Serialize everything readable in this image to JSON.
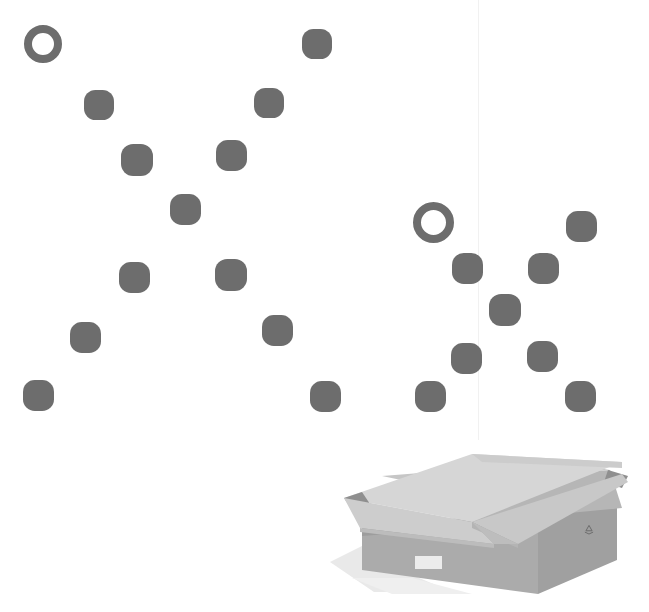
{
  "canvas": {
    "width": 649,
    "height": 612,
    "background": "#ffffff",
    "description": "Two X-shaped scatter patterns of gray rounded dots with one hollow ring each, above an open cardboard box"
  },
  "palette": {
    "dot_fill": "#6d6d6d",
    "ring_stroke": "#6d6d6d",
    "guide_line": "#f1f1f1",
    "box_flap_top": "#d3d3d3",
    "box_flap_light": "#c9c9c9",
    "box_inner": "#b9b9b9",
    "box_front": "#a9a9a9",
    "box_side": "#9b9b9b",
    "box_edge": "#8a8a8a",
    "box_shadow": "#e3e3e3",
    "label_white": "#eeeeee",
    "recycle_mark": "#6a6a6a"
  },
  "guide_lines": [
    {
      "name": "vertical-guide",
      "x": 478,
      "y": 0,
      "height": 440,
      "color": "#f1f1f1"
    }
  ],
  "clusters": [
    {
      "name": "left-cluster",
      "shape": "x-pattern",
      "count": 13,
      "ring_count": 1,
      "dot_count": 12
    },
    {
      "name": "right-cluster",
      "shape": "x-pattern",
      "count": 10,
      "ring_count": 1,
      "dot_count": 9
    }
  ],
  "marks": [
    {
      "id": "left-ring-1",
      "cluster": "left",
      "type": "ring",
      "cx": 43,
      "cy": 44,
      "size": 38,
      "stroke": 8,
      "color": "#6d6d6d"
    },
    {
      "id": "left-dot-1",
      "cluster": "left",
      "type": "dot",
      "cx": 99,
      "cy": 105,
      "size": 30,
      "color": "#6d6d6d"
    },
    {
      "id": "left-dot-2",
      "cluster": "left",
      "type": "dot",
      "cx": 137,
      "cy": 160,
      "size": 32,
      "color": "#6d6d6d"
    },
    {
      "id": "left-dot-3",
      "cluster": "left",
      "type": "dot",
      "cx": 185,
      "cy": 209,
      "size": 31,
      "color": "#6d6d6d"
    },
    {
      "id": "left-dot-4",
      "cluster": "left",
      "type": "dot",
      "cx": 231,
      "cy": 155,
      "size": 31,
      "color": "#6d6d6d"
    },
    {
      "id": "left-dot-5",
      "cluster": "left",
      "type": "dot",
      "cx": 269,
      "cy": 103,
      "size": 30,
      "color": "#6d6d6d"
    },
    {
      "id": "left-dot-6",
      "cluster": "left",
      "type": "dot",
      "cx": 317,
      "cy": 44,
      "size": 30,
      "color": "#6d6d6d"
    },
    {
      "id": "left-dot-7",
      "cluster": "left",
      "type": "dot",
      "cx": 134,
      "cy": 277,
      "size": 31,
      "color": "#6d6d6d"
    },
    {
      "id": "left-dot-8",
      "cluster": "left",
      "type": "dot",
      "cx": 231,
      "cy": 275,
      "size": 32,
      "color": "#6d6d6d"
    },
    {
      "id": "left-dot-9",
      "cluster": "left",
      "type": "dot",
      "cx": 85,
      "cy": 337,
      "size": 31,
      "color": "#6d6d6d"
    },
    {
      "id": "left-dot-10",
      "cluster": "left",
      "type": "dot",
      "cx": 277,
      "cy": 330,
      "size": 31,
      "color": "#6d6d6d"
    },
    {
      "id": "left-dot-11",
      "cluster": "left",
      "type": "dot",
      "cx": 38,
      "cy": 395,
      "size": 31,
      "color": "#6d6d6d"
    },
    {
      "id": "left-dot-12",
      "cluster": "left",
      "type": "dot",
      "cx": 325,
      "cy": 396,
      "size": 31,
      "color": "#6d6d6d"
    },
    {
      "id": "right-ring-1",
      "cluster": "right",
      "type": "ring",
      "cx": 433,
      "cy": 222,
      "size": 41,
      "stroke": 8,
      "color": "#6d6d6d"
    },
    {
      "id": "right-dot-1",
      "cluster": "right",
      "type": "dot",
      "cx": 467,
      "cy": 268,
      "size": 31,
      "color": "#6d6d6d"
    },
    {
      "id": "right-dot-2",
      "cluster": "right",
      "type": "dot",
      "cx": 505,
      "cy": 310,
      "size": 32,
      "color": "#6d6d6d"
    },
    {
      "id": "right-dot-3",
      "cluster": "right",
      "type": "dot",
      "cx": 543,
      "cy": 268,
      "size": 31,
      "color": "#6d6d6d"
    },
    {
      "id": "right-dot-4",
      "cluster": "right",
      "type": "dot",
      "cx": 581,
      "cy": 226,
      "size": 31,
      "color": "#6d6d6d"
    },
    {
      "id": "right-dot-5",
      "cluster": "right",
      "type": "dot",
      "cx": 466,
      "cy": 358,
      "size": 31,
      "color": "#6d6d6d"
    },
    {
      "id": "right-dot-6",
      "cluster": "right",
      "type": "dot",
      "cx": 542,
      "cy": 356,
      "size": 31,
      "color": "#6d6d6d"
    },
    {
      "id": "right-dot-7",
      "cluster": "right",
      "type": "dot",
      "cx": 430,
      "cy": 396,
      "size": 31,
      "color": "#6d6d6d"
    },
    {
      "id": "right-dot-8",
      "cluster": "right",
      "type": "dot",
      "cx": 580,
      "cy": 396,
      "size": 31,
      "color": "#6d6d6d"
    }
  ],
  "box": {
    "name": "open-cardboard-box",
    "x": 322,
    "y": 452,
    "width": 320,
    "height": 160,
    "parts": [
      "left-flap",
      "back-flap",
      "right-flap",
      "front-flap",
      "inner-wall",
      "front-face",
      "right-side-face",
      "drop-shadow"
    ],
    "markings": {
      "recycle_symbol": {
        "name": "recycle-icon",
        "x": 589,
        "y": 529
      },
      "shipping_label": {
        "name": "shipping-label",
        "x": 415,
        "y": 556,
        "width": 27,
        "height": 13
      }
    }
  }
}
